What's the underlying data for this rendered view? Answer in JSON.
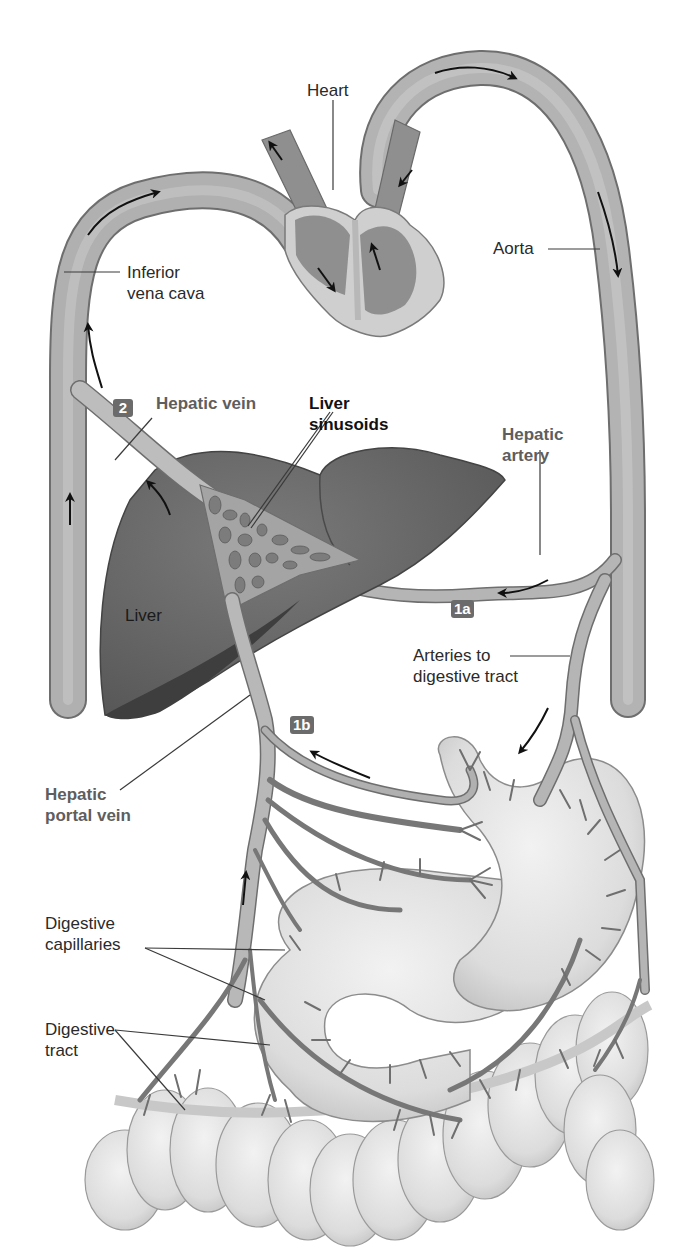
{
  "diagram": {
    "labels": {
      "heart": "Heart",
      "aorta": "Aorta",
      "inferior_vena_cava": [
        "Inferior",
        "vena cava"
      ],
      "hepatic_vein": "Hepatic vein",
      "liver_sinusoids": [
        "Liver",
        "sinusoids"
      ],
      "hepatic_artery": [
        "Hepatic",
        "artery"
      ],
      "liver": "Liver",
      "arteries_to_digestive_tract": [
        "Arteries to",
        "digestive tract"
      ],
      "hepatic_portal_vein": [
        "Hepatic",
        "portal vein"
      ],
      "digestive_capillaries": [
        "Digestive",
        "capillaries"
      ],
      "digestive_tract": [
        "Digestive",
        "tract"
      ]
    },
    "step_badges": {
      "step_1a": "1a",
      "step_1b": "1b",
      "step_2": "2"
    },
    "colors": {
      "vessel_fill": "#a9a9a9",
      "vessel_edge": "#6e6e6e",
      "liver_fill": "#6a6a6a",
      "liver_shadow": "#3e3e3e",
      "heart_chamber": "#8f8f8f",
      "heart_wall": "#cfcfcf",
      "gut_fill": "#e4e4e4",
      "badge_bg": "#6b6b6b",
      "label_text": "#2a2a2a",
      "label_highlight_text": "#5e5e5e",
      "arrow": "#111111"
    }
  }
}
